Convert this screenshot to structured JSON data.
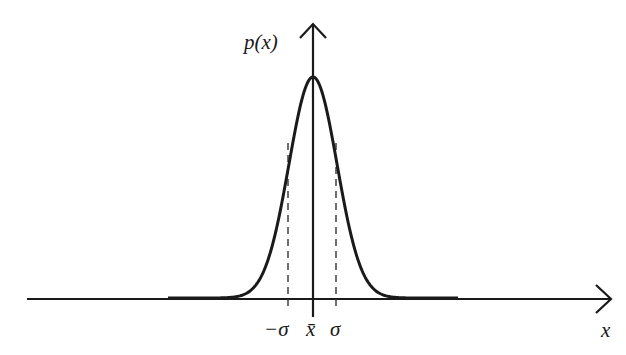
{
  "chart_data": {
    "type": "line",
    "ylabel": "p(x)",
    "xlabel": "x",
    "tick_labels": [
      "−σ",
      "x̄",
      "σ"
    ],
    "annotations": [
      "dashed vertical lines at −σ and σ",
      "vertical axis at mean x̄"
    ],
    "curve": "bell-shaped, symmetric about x̄",
    "grid": false,
    "legend": "none"
  },
  "labels": {
    "y_axis": "p(x)",
    "x_axis": "x",
    "minus_sigma": "−σ",
    "mean": "x̄",
    "sigma": "σ"
  },
  "colors": {
    "line": "#1a1a1a",
    "background": "#ffffff"
  }
}
